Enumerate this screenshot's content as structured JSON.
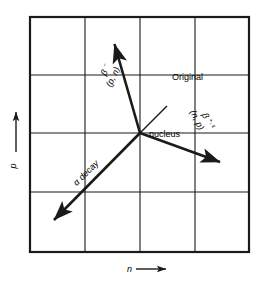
{
  "figure": {
    "title_present": false,
    "background_color": "#ffffff",
    "line_color": "#1a1a1a",
    "grid": {
      "columns": 4,
      "rows": 4,
      "x_lines": [
        30,
        85,
        140,
        195,
        249
      ],
      "y_lines": [
        17,
        75,
        133,
        192,
        252
      ],
      "outer_border_width": 2.2,
      "inner_line_width": 1.1
    },
    "axes": {
      "x": {
        "label": "n",
        "arrow_glyph": "⟶",
        "arrow_direction": "right",
        "position": "below-grid"
      },
      "y": {
        "label": "p",
        "arrow_glyph": "⟶",
        "arrow_direction": "up",
        "position": "left-of-grid"
      }
    },
    "center_point": {
      "x": 140,
      "y": 133,
      "label_top": "Original",
      "label_bottom": "nucleus"
    },
    "arrows": [
      {
        "name": "beta-minus",
        "label_main": "β",
        "label_superscript": "−",
        "label_sub": "(p, n)",
        "from": {
          "x": 140,
          "y": 133
        },
        "to": {
          "x": 113,
          "y": 42
        },
        "rotation_deg": -64,
        "direction": "upper-left"
      },
      {
        "name": "beta-plus-epsilon",
        "label_main": "β",
        "label_superscript": "+, ε",
        "label_sub": "(n, p)",
        "from": {
          "x": 140,
          "y": 133
        },
        "to": {
          "x": 222,
          "y": 163
        },
        "rotation_deg": 64,
        "direction": "lower-right"
      },
      {
        "name": "alpha-decay",
        "label_main": "α decay",
        "label_superscript": "",
        "label_sub": "",
        "from": {
          "x": 140,
          "y": 133
        },
        "to": {
          "x": 52,
          "y": 222
        },
        "rotation_deg": 45,
        "direction": "lower-left"
      }
    ],
    "leader_line": {
      "name": "original-nucleus-leader",
      "from": {
        "x": 140,
        "y": 133
      },
      "to": {
        "x": 167,
        "y": 106
      }
    }
  }
}
